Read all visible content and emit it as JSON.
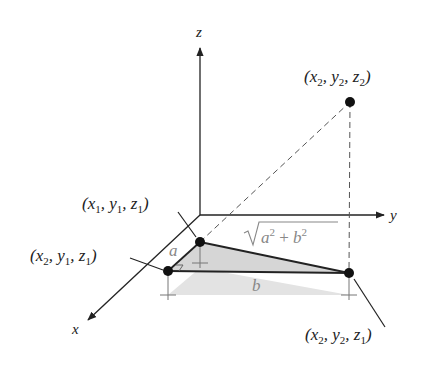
{
  "diagram": {
    "axes": {
      "x": "x",
      "y": "y",
      "z": "z"
    },
    "points": [
      {
        "id": "p2",
        "label": [
          "x",
          "2",
          "y",
          "2",
          "z",
          "2"
        ]
      },
      {
        "id": "p1",
        "label": [
          "x",
          "1",
          "y",
          "1",
          "z",
          "1"
        ]
      },
      {
        "id": "q",
        "label": [
          "x",
          "2",
          "y",
          "1",
          "z",
          "1"
        ]
      },
      {
        "id": "r",
        "label": [
          "x",
          "2",
          "y",
          "2",
          "z",
          "1"
        ]
      }
    ],
    "segment_labels": {
      "a": "a",
      "b": "b",
      "hyp_a": "a",
      "hyp_b": "b",
      "plus": " + ",
      "sq": "2"
    },
    "colors": {
      "line": "#222222",
      "shade": "#d9d9d9",
      "shade_dark": "#c4c4c4",
      "gray_text": "#888888"
    }
  }
}
